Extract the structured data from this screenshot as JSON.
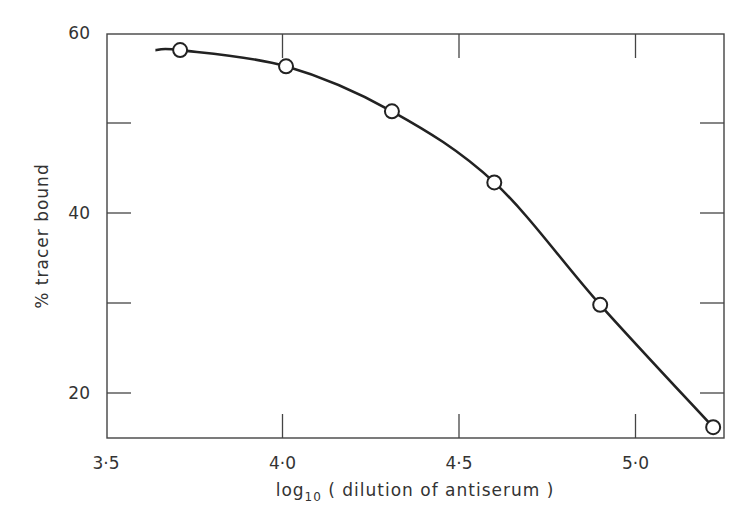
{
  "chart_data": {
    "type": "line",
    "title": "",
    "xlabel": "log10 (dilution of antiserum)",
    "xlabel_main": "log",
    "xlabel_sub": "10",
    "xlabel_rest": " ( dilution  of  antiserum )",
    "ylabel": "% tracer bound",
    "xlim": [
      3.5,
      5.25
    ],
    "ylim": [
      15,
      60
    ],
    "x_ticks": [
      {
        "value": 3.5,
        "label": "3·5"
      },
      {
        "value": 4.0,
        "label": "4·0"
      },
      {
        "value": 4.5,
        "label": "4·5"
      },
      {
        "value": 5.0,
        "label": "5·0"
      }
    ],
    "y_ticks": [
      {
        "value": 20,
        "label": "20"
      },
      {
        "value": 30,
        "label": ""
      },
      {
        "value": 40,
        "label": "40"
      },
      {
        "value": 50,
        "label": ""
      },
      {
        "value": 60,
        "label": "60"
      }
    ],
    "grid": false,
    "legend": null,
    "series": [
      {
        "name": "% tracer bound",
        "marker": "open-circle",
        "curve_start_x": 3.64,
        "x": [
          3.71,
          4.01,
          4.31,
          4.6,
          4.9,
          5.22
        ],
        "y": [
          58.1,
          56.3,
          51.3,
          43.4,
          29.8,
          16.2
        ]
      }
    ]
  }
}
